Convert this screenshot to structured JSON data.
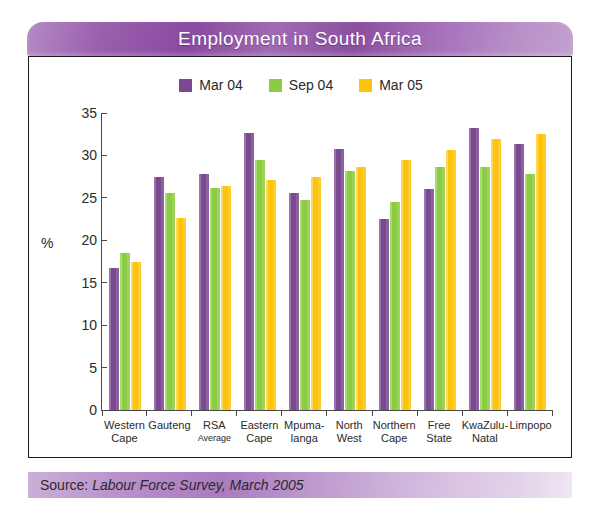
{
  "title": "Employment in South Africa",
  "source": {
    "prefix": "Source:",
    "detail": "Labour Force Survey, March 2005"
  },
  "colors": {
    "series_mar04": "#7A4A8E",
    "series_sep04": "#8CCB46",
    "series_mar05": "#FCC30F",
    "banner_purple": "#8A4A9F",
    "axis": "#4A4A4A",
    "text": "#2A2A2A"
  },
  "legend": {
    "position": "top-center",
    "items": [
      {
        "label": "Mar 04",
        "color": "#7A4A8E",
        "swatch_name": "legend-swatch-mar04"
      },
      {
        "label": "Sep 04",
        "color": "#8CCB46",
        "swatch_name": "legend-swatch-sep04"
      },
      {
        "label": "Mar 05",
        "color": "#FCC30F",
        "swatch_name": "legend-swatch-mar05"
      }
    ]
  },
  "chart_data": {
    "type": "bar",
    "title": "Employment in South Africa",
    "subtitle": "",
    "xlabel": "",
    "ylabel": "%",
    "ylim": [
      0,
      35
    ],
    "yticks": [
      0,
      5,
      10,
      15,
      20,
      25,
      30,
      35
    ],
    "grid": false,
    "legend_position": "top-center",
    "categories": [
      "Western Cape",
      "Gauteng",
      "RSA Average",
      "Eastern Cape",
      "Mpumalanga",
      "North West",
      "Northern Cape",
      "Free State",
      "KwaZulu-Natal",
      "Limpopo"
    ],
    "category_lines": [
      [
        "Western",
        "Cape"
      ],
      [
        "Gauteng",
        ""
      ],
      [
        "RSA",
        "Average"
      ],
      [
        "Eastern",
        "Cape"
      ],
      [
        "Mpuma-",
        "langa"
      ],
      [
        "North",
        "West"
      ],
      [
        "Northern",
        "Cape"
      ],
      [
        "Free",
        "State"
      ],
      [
        "KwaZulu-",
        "Natal"
      ],
      [
        "Limpopo",
        ""
      ]
    ],
    "series": [
      {
        "name": "Mar 04",
        "color": "#7A4A8E",
        "values": [
          16.7,
          27.5,
          27.8,
          32.6,
          25.6,
          30.8,
          22.5,
          26.1,
          33.2,
          31.4
        ]
      },
      {
        "name": "Sep 04",
        "color": "#8CCB46",
        "values": [
          18.5,
          25.6,
          26.2,
          29.5,
          24.8,
          28.2,
          24.5,
          28.7,
          28.7,
          27.8
        ]
      },
      {
        "name": "Mar 05",
        "color": "#FCC30F",
        "values": [
          17.5,
          22.6,
          26.4,
          27.1,
          27.5,
          28.7,
          29.5,
          30.6,
          31.9,
          32.5
        ]
      }
    ],
    "source": "Source: Labour Force Survey, March 2005"
  }
}
